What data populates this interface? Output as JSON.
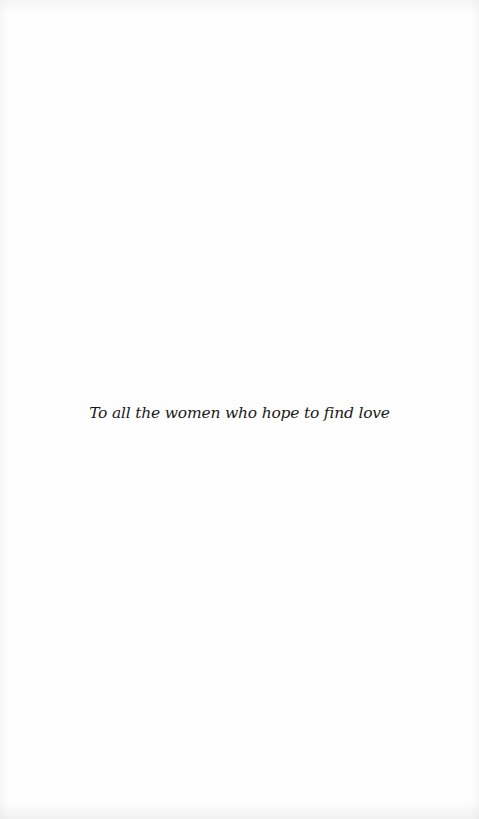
{
  "page": {
    "type": "dedication",
    "background_color": "#fefefe",
    "text_color": "#1a1a1a"
  },
  "dedication": {
    "text": "To all the women who hope to find love"
  }
}
